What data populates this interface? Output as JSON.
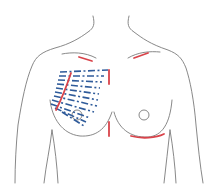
{
  "diagram": {
    "colors": {
      "outline": "#7a7a7a",
      "marking_lines": "#d9434a",
      "direction_lines": "#2f5b9a",
      "background": "#ffffff"
    },
    "elements": {
      "torso_outline": "body contour (neck, shoulders, arms, chest)",
      "left_breast_outline": "breast contour with nipple circle (viewer's left)",
      "right_breast_outline": "breast contour with nipple circle (viewer's right)",
      "red_markings": [
        "upper-left clavicle mark",
        "upper-right clavicle mark",
        "sternal upper mark",
        "sternal lower mark",
        "left lateral diagonal mark",
        "right inframammary fold mark"
      ],
      "blue_dashed_lines_count": 11
    }
  }
}
